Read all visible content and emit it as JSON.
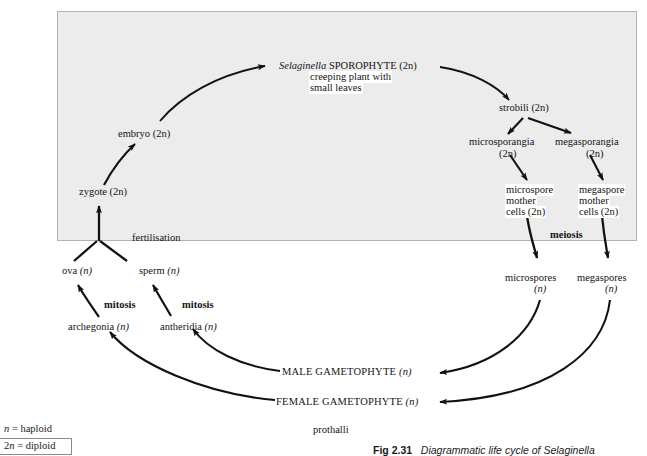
{
  "figure": {
    "caption_number": "Fig 2.31",
    "caption_text": "Diagrammatic life cycle of Selaginella",
    "prothalli_label": "prothalli"
  },
  "legend": {
    "haploid": "n = haploid",
    "diploid": "2n = diploid"
  },
  "nodes": {
    "sporophyte_name": "Selaginella",
    "sporophyte_title": " SPOROPHYTE (2n)",
    "sporophyte_desc_line1": "creeping plant with",
    "sporophyte_desc_line2": "small leaves",
    "strobili": "strobili (2n)",
    "microsporangia_line1": "microsporangia",
    "microsporangia_line2": "(2n)",
    "megasporangia_line1": "megasporangia",
    "megasporangia_line2": "(2n)",
    "microspore_mother_line1": "microspore",
    "microspore_mother_line2": "mother",
    "microspore_mother_line3": "cells (2n)",
    "megaspore_mother_line1": "megaspore",
    "megaspore_mother_line2": "mother",
    "megaspore_mother_line3": "cells (2n)",
    "microspores_line1": "microspores",
    "microspores_line2": "(n)",
    "megaspores_line1": "megaspores",
    "megaspores_line2": "(n)",
    "male_gametophyte": "MALE GAMETOPHYTE ",
    "male_gametophyte_ploidy": "(n)",
    "female_gametophyte": "FEMALE GAMETOPHYTE ",
    "female_gametophyte_ploidy": "(n)",
    "antheridia": "antheridia ",
    "antheridia_ploidy": "(n)",
    "archegonia": "archegonia ",
    "archegonia_ploidy": "(n)",
    "sperm": "sperm ",
    "sperm_ploidy": "(n)",
    "ova": "ova ",
    "ova_ploidy": "(n)",
    "zygote": "zygote (2n)",
    "embryo": "embryo (2n)"
  },
  "processes": {
    "meiosis": "meiosis",
    "mitosis_left": "mitosis",
    "mitosis_right": "mitosis",
    "fertilisation": "fertilisation"
  },
  "colors": {
    "diploid_zone_fill": "#ececed",
    "diploid_zone_border": "#b3b3b3",
    "arrow": "#111111",
    "text": "#141414"
  }
}
